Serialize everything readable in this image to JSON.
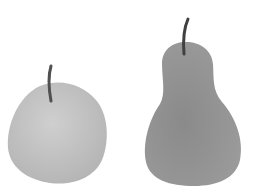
{
  "scene": {
    "background": "#ffffff",
    "objects": [
      {
        "name": "apple",
        "fill": "#c2c2c2",
        "stem": "#555555"
      },
      {
        "name": "pear",
        "fill": "#8f8f8f",
        "stem": "#4a4a4a"
      }
    ]
  }
}
